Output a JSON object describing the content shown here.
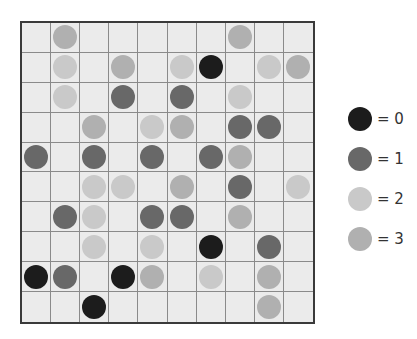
{
  "puzzle": {
    "rows": 10,
    "cols": 10,
    "grid": [
      [
        null,
        3,
        null,
        null,
        null,
        null,
        null,
        3,
        null,
        null
      ],
      [
        null,
        2,
        null,
        3,
        null,
        2,
        0,
        null,
        2,
        3
      ],
      [
        null,
        2,
        null,
        1,
        null,
        1,
        null,
        2,
        null,
        null
      ],
      [
        null,
        null,
        3,
        null,
        2,
        3,
        null,
        1,
        1,
        null
      ],
      [
        1,
        null,
        1,
        null,
        1,
        null,
        1,
        3,
        null,
        null
      ],
      [
        null,
        null,
        2,
        2,
        null,
        3,
        null,
        1,
        null,
        2
      ],
      [
        null,
        1,
        2,
        null,
        1,
        1,
        null,
        3,
        null,
        null
      ],
      [
        null,
        null,
        2,
        null,
        2,
        null,
        0,
        null,
        1,
        null
      ],
      [
        0,
        1,
        null,
        0,
        3,
        null,
        2,
        null,
        3,
        null
      ],
      [
        null,
        null,
        0,
        null,
        null,
        null,
        null,
        null,
        3,
        null
      ]
    ]
  },
  "colors": {
    "0": "#1c1c1c",
    "1": "#686868",
    "2": "#c9c9c9",
    "3": "#b0b0b0",
    "cell_bg": "#ebebeb",
    "grid_line": "#8a8a8a",
    "border": "#3a3a3a"
  },
  "legend": {
    "items": [
      {
        "value": 0,
        "label": "= 0",
        "color": "#1c1c1c"
      },
      {
        "value": 1,
        "label": "= 1",
        "color": "#686868"
      },
      {
        "value": 2,
        "label": "= 2",
        "color": "#c9c9c9"
      },
      {
        "value": 3,
        "label": "= 3",
        "color": "#b0b0b0"
      }
    ]
  }
}
